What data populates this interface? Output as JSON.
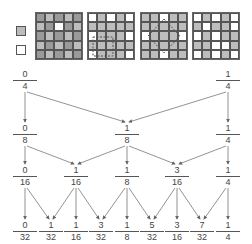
{
  "grids": [
    {
      "name": "fine-checker-grid",
      "rows": 5,
      "cols": 5
    },
    {
      "name": "square-window-grid",
      "rows": 5,
      "cols": 5,
      "overlay": "dashed-square"
    },
    {
      "name": "diamond-window-grid",
      "rows": 5,
      "cols": 5,
      "overlay": "dashed-diamond"
    },
    {
      "name": "sparse-grid",
      "rows": 5,
      "cols": 5
    }
  ],
  "legend_icons": [
    "filled-small-square-icon",
    "empty-small-square-icon"
  ],
  "levels": [
    {
      "y": 70,
      "nodes": [
        {
          "num": "0",
          "den": "4",
          "x": 25
        },
        {
          "num": "1",
          "den": "4",
          "x": 228
        }
      ]
    },
    {
      "y": 124,
      "nodes": [
        {
          "num": "0",
          "den": "8",
          "x": 25
        },
        {
          "num": "1",
          "den": "8",
          "x": 127
        },
        {
          "num": "1",
          "den": "4",
          "x": 228
        }
      ]
    },
    {
      "y": 166,
      "nodes": [
        {
          "num": "0",
          "den": "16",
          "x": 25
        },
        {
          "num": "1",
          "den": "16",
          "x": 76
        },
        {
          "num": "1",
          "den": "8",
          "x": 127
        },
        {
          "num": "3",
          "den": "16",
          "x": 177
        },
        {
          "num": "1",
          "den": "4",
          "x": 228
        }
      ]
    },
    {
      "y": 221,
      "nodes": [
        {
          "num": "0",
          "den": "32",
          "x": 25
        },
        {
          "num": "1",
          "den": "32",
          "x": 51
        },
        {
          "num": "1",
          "den": "16",
          "x": 76
        },
        {
          "num": "3",
          "den": "32",
          "x": 101
        },
        {
          "num": "1",
          "den": "8",
          "x": 127
        },
        {
          "num": "5",
          "den": "32",
          "x": 152
        },
        {
          "num": "3",
          "den": "16",
          "x": 177
        },
        {
          "num": "7",
          "den": "32",
          "x": 202
        },
        {
          "num": "1",
          "den": "4",
          "x": 228
        }
      ]
    }
  ]
}
